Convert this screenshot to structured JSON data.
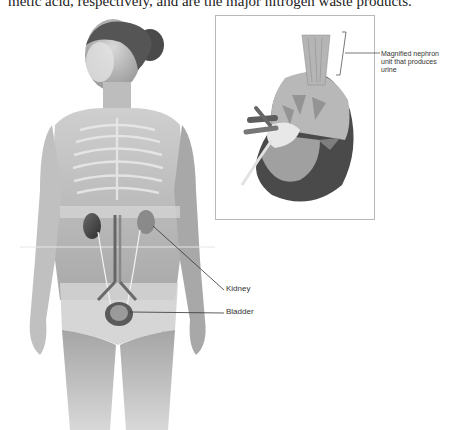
{
  "document": {
    "top_text": "metic acid, respectively, and are the major nitrogen waste products."
  },
  "figure": {
    "main_illustration": "Woman figure with transparent overlay of urinary system",
    "inset_illustration": "Cross-section of kidney",
    "labels": {
      "nephron": "Magnified nephron unit that produces urine",
      "kidney": "Kidney",
      "bladder": "Bladder"
    }
  }
}
